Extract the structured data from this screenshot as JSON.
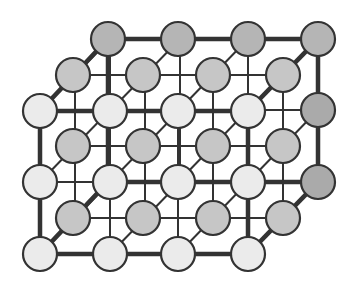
{
  "diagram": {
    "type": "3d-cubic-lattice",
    "grid": {
      "columns": 4,
      "rows": 3,
      "layers": 3,
      "spacing": 70,
      "depth_offset": [
        35,
        -36
      ]
    },
    "colors": {
      "background": "#ffffff",
      "stroke": "#333333",
      "front_layer": "#ebebeb",
      "middle_layer": "#c6c6c6",
      "back_layer_top": "#b5b5b5",
      "back_layer_right": "#aaaaaa"
    },
    "layers": [
      {
        "name": "back",
        "fill": "#b5b5b5",
        "atoms": [
          [
            108,
            39
          ],
          [
            178,
            39
          ],
          [
            248,
            39
          ],
          [
            318,
            39
          ]
        ]
      },
      {
        "name": "back-right",
        "fill": "#aaaaaa",
        "atoms": [
          [
            318,
            110
          ],
          [
            318,
            182
          ]
        ]
      },
      {
        "name": "middle",
        "fill": "#c6c6c6",
        "atoms": [
          [
            73,
            75
          ],
          [
            143,
            75
          ],
          [
            213,
            75
          ],
          [
            283,
            75
          ],
          [
            73,
            146
          ],
          [
            143,
            146
          ],
          [
            213,
            146
          ],
          [
            283,
            146
          ],
          [
            73,
            218
          ],
          [
            143,
            218
          ],
          [
            213,
            218
          ],
          [
            283,
            218
          ]
        ]
      },
      {
        "name": "front",
        "fill": "#ebebeb",
        "atoms": [
          [
            40,
            111
          ],
          [
            110,
            111
          ],
          [
            178,
            111
          ],
          [
            248,
            111
          ],
          [
            40,
            182
          ],
          [
            110,
            182
          ],
          [
            178,
            182
          ],
          [
            248,
            182
          ],
          [
            40,
            254
          ],
          [
            110,
            254
          ],
          [
            178,
            254
          ],
          [
            248,
            254
          ]
        ]
      }
    ],
    "atom_radius": 17,
    "bold_edges": [
      [
        [
          40,
          111
        ],
        [
          248,
          111
        ]
      ],
      [
        [
          40,
          254
        ],
        [
          248,
          254
        ]
      ],
      [
        [
          40,
          111
        ],
        [
          40,
          254
        ]
      ],
      [
        [
          248,
          111
        ],
        [
          248,
          254
        ]
      ],
      [
        [
          108,
          39
        ],
        [
          318,
          39
        ]
      ],
      [
        [
          108,
          182
        ],
        [
          318,
          182
        ]
      ],
      [
        [
          108,
          39
        ],
        [
          108,
          182
        ]
      ],
      [
        [
          318,
          39
        ],
        [
          318,
          182
        ]
      ],
      [
        [
          40,
          111
        ],
        [
          108,
          39
        ]
      ],
      [
        [
          248,
          111
        ],
        [
          318,
          39
        ]
      ],
      [
        [
          248,
          254
        ],
        [
          318,
          182
        ]
      ],
      [
        [
          40,
          254
        ],
        [
          108,
          182
        ]
      ]
    ]
  }
}
